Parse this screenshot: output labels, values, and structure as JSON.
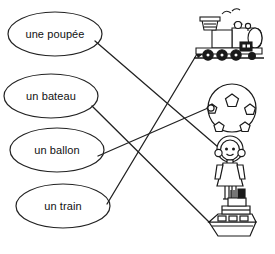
{
  "worksheet": {
    "title": "Matching exercise: French toy words to pictures",
    "language": "fr",
    "ink_color": "#1a1a1a",
    "background_color": "#ffffff"
  },
  "words": [
    {
      "id": "poupee",
      "label": "une poupée",
      "oval": {
        "cx": 55,
        "cy": 34,
        "rx": 47,
        "ry": 22
      },
      "anchor": {
        "x": 95,
        "y": 41
      }
    },
    {
      "id": "bateau",
      "label": "un bateau",
      "oval": {
        "cx": 51,
        "cy": 96,
        "rx": 47,
        "ry": 22
      },
      "anchor": {
        "x": 92,
        "y": 106
      }
    },
    {
      "id": "ballon",
      "label": "un ballon",
      "oval": {
        "cx": 57,
        "cy": 150,
        "rx": 47,
        "ry": 22
      },
      "anchor": {
        "x": 98,
        "y": 156
      }
    },
    {
      "id": "train",
      "label": "un train",
      "oval": {
        "cx": 63,
        "cy": 206,
        "rx": 47,
        "ry": 22
      },
      "anchor": {
        "x": 107,
        "y": 204
      }
    }
  ],
  "pictures": [
    {
      "id": "train",
      "name": "train-locomotive-picture",
      "anchor": {
        "x": 197,
        "y": 54
      }
    },
    {
      "id": "ballon",
      "name": "soccer-ball-picture",
      "anchor": {
        "x": 208,
        "y": 108
      }
    },
    {
      "id": "poupee",
      "name": "doll-girl-picture",
      "anchor": {
        "x": 218,
        "y": 147
      }
    },
    {
      "id": "bateau",
      "name": "boat-ship-picture",
      "anchor": {
        "x": 209,
        "y": 222
      }
    }
  ],
  "connections": [
    {
      "from": "poupee",
      "to": "poupee",
      "x1": 95,
      "y1": 41,
      "x2": 218,
      "y2": 147
    },
    {
      "from": "bateau",
      "to": "bateau",
      "x1": 92,
      "y1": 106,
      "x2": 209,
      "y2": 222
    },
    {
      "from": "ballon",
      "to": "ballon",
      "x1": 98,
      "y1": 156,
      "x2": 208,
      "y2": 108
    },
    {
      "from": "train",
      "to": "train",
      "x1": 107,
      "y1": 204,
      "x2": 197,
      "y2": 54
    }
  ]
}
